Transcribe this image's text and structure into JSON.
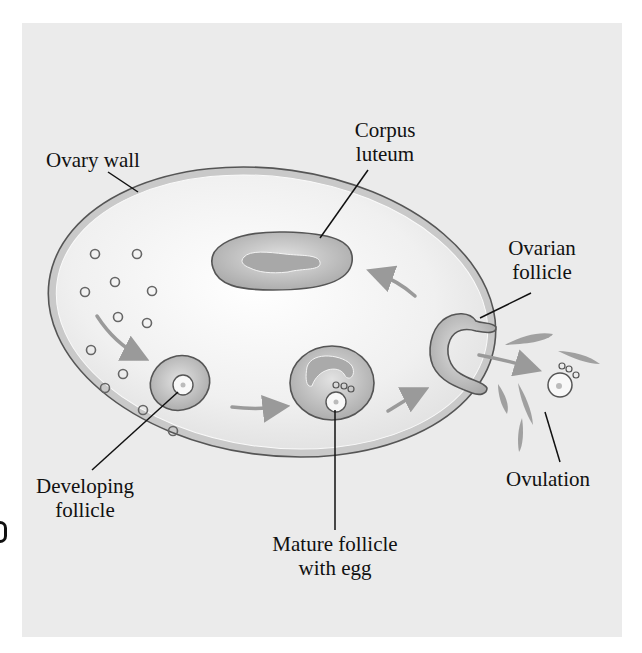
{
  "diagram": {
    "type": "ovarian cycle illustration",
    "labels": {
      "ovary_wall": "Ovary wall",
      "corpus_luteum_1": "Corpus",
      "corpus_luteum_2": "luteum",
      "ovarian_follicle_1": "Ovarian",
      "ovarian_follicle_2": "follicle",
      "developing_follicle_1": "Developing",
      "developing_follicle_2": "follicle",
      "mature_follicle_1": "Mature follicle",
      "mature_follicle_2": "with egg",
      "ovulation": "Ovulation"
    },
    "colors": {
      "background": "#ebebeb",
      "ovary_fill": "#f4f4f4",
      "ovary_wall": "#c6c6c6",
      "outline": "#555555",
      "structure_fill": "#bdbdbd",
      "arrow": "#9a9a9a",
      "label_text": "#111111"
    }
  }
}
